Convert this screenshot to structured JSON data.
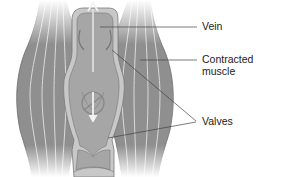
{
  "diagram": {
    "type": "anatomical-illustration",
    "labels": {
      "vein": "Vein",
      "contracted_muscle_line1": "Contracted",
      "contracted_muscle_line2": "muscle",
      "valves": "Valves"
    },
    "colors": {
      "muscle": "#8f8f8f",
      "muscle_stripe": "#d9d9d9",
      "vein_wall": "#c8c8c8",
      "vein_lumen": "#a6a6a6",
      "leader_line": "#444444",
      "background": "#ffffff"
    },
    "arrows": {
      "upward_flow": "open valve, blood pushed up",
      "downward_flow": "closed valve, backflow blocked"
    }
  }
}
